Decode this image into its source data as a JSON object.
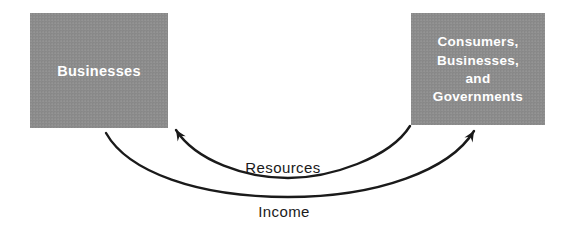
{
  "diagram": {
    "box_fill_color": "#8c8c8c",
    "box_text_color": "#ffffff",
    "arrow_color": "#1a1a1a",
    "background_color": "#ffffff",
    "left_box": {
      "label": "Businesses"
    },
    "right_box": {
      "lines": [
        "Consumers,",
        "Businesses,",
        "and",
        "Governments"
      ]
    },
    "arrows": [
      {
        "label": "Resources",
        "direction": "right-to-left",
        "from": "Consumers, Businesses, and Governments",
        "to": "Businesses"
      },
      {
        "label": "Income",
        "direction": "left-to-right",
        "from": "Businesses",
        "to": "Consumers, Businesses, and Governments"
      }
    ]
  }
}
